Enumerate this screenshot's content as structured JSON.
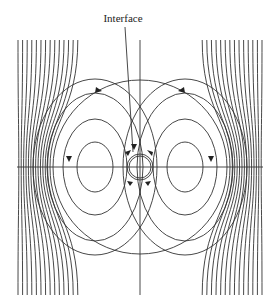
{
  "figure": {
    "type": "flow-field-diagram",
    "annotation": {
      "label": "Interface",
      "x": 123,
      "y": 19
    },
    "center": {
      "x": 140,
      "y": 167
    },
    "outer_circle_radius": 87,
    "interface_radius": 13,
    "axes": {
      "horizontal": {
        "x1": 17,
        "x2": 263,
        "y": 167
      },
      "vertical": {
        "x": 140,
        "y1": 40,
        "y2": 295
      }
    },
    "colors": {
      "stroke": "#333333",
      "background": "#ffffff"
    }
  }
}
